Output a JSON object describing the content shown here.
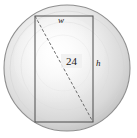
{
  "figure": {
    "type": "geometry-diagram",
    "background_color": "#ffffff"
  },
  "circle": {
    "name": "log-cross-section",
    "center_x": 67,
    "center_y": 68,
    "radius": 63,
    "fill_center_color": "#fdfdfd",
    "fill_mid_color": "#e4e4e4",
    "fill_edge_color": "#b9b9b9",
    "stroke_color": "#8a8a8a"
  },
  "rectangle": {
    "name": "inscribed-beam-rectangle",
    "left": 35,
    "top": 16,
    "right": 93,
    "bottom": 122,
    "width": 58,
    "height": 106,
    "stroke_color": "#4a4a4a",
    "fill": "none"
  },
  "diagonal": {
    "name": "diameter-diagonal",
    "x1": 35,
    "y1": 16,
    "x2": 93,
    "y2": 122,
    "stroke_color": "#6b6b6b",
    "dash_pattern": "3 2"
  },
  "labels": {
    "width": "w",
    "height": "h",
    "diagonal": "24"
  }
}
